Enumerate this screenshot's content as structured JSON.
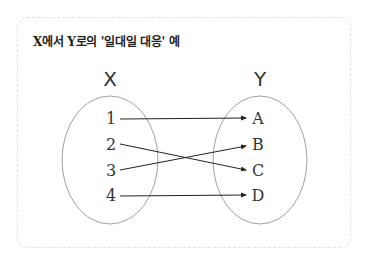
{
  "title": "X에서 Y로의 '일대일 대응' 예",
  "sets": {
    "domain": {
      "label": "X",
      "elements": [
        "1",
        "2",
        "3",
        "4"
      ]
    },
    "codomain": {
      "label": "Y",
      "elements": [
        "A",
        "B",
        "C",
        "D"
      ]
    }
  },
  "mapping": [
    {
      "from": "1",
      "to": "A"
    },
    {
      "from": "2",
      "to": "C"
    },
    {
      "from": "3",
      "to": "B"
    },
    {
      "from": "4",
      "to": "D"
    }
  ],
  "colors": {
    "line": "#222222",
    "ellipse": "#888888",
    "border": "#e2e2e2"
  }
}
